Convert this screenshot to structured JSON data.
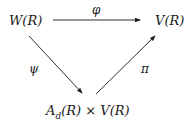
{
  "diagram": {
    "type": "commutative-triangle",
    "nodes": {
      "top_left": "W(R)",
      "top_right": "V(R)",
      "bottom": {
        "base": "A",
        "subscript": "d",
        "rest": "(R) × V(R)"
      }
    },
    "arrows": [
      {
        "from": "W(R)",
        "to": "V(R)",
        "label": "φ"
      },
      {
        "from": "W(R)",
        "to": "A_d(R) × V(R)",
        "label": "ψ"
      },
      {
        "from": "A_d(R) × V(R)",
        "to": "V(R)",
        "label": "π"
      }
    ],
    "colors": {
      "ink": "#1a1a1a",
      "background": "#ffffff"
    }
  }
}
